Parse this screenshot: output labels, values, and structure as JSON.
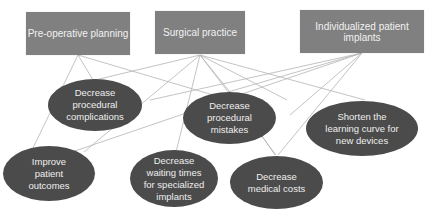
{
  "diagram": {
    "colors": {
      "box": "#808080",
      "ellipse": "#4b4b4b",
      "line": "#b0b0b0",
      "text": "#eeeeee"
    },
    "sources": [
      {
        "id": "pre",
        "label": "Pre-operative planning"
      },
      {
        "id": "surg",
        "label": "Surgical practice"
      },
      {
        "id": "impl",
        "label": "Individualized patient implants"
      }
    ],
    "outcomes": [
      {
        "id": "comp",
        "label": "Decrease\nprocedural\ncomplications"
      },
      {
        "id": "mist",
        "label": "Decrease\nprocedural\nmistakes"
      },
      {
        "id": "learn",
        "label": "Shorten the\nlearning curve for\nnew devices"
      },
      {
        "id": "outc",
        "label": "Improve\npatient\noutcomes"
      },
      {
        "id": "wait",
        "label": "Decrease\nwaiting times\nfor specialized\nimplants"
      },
      {
        "id": "cost",
        "label": "Decrease\nmedical costs"
      }
    ],
    "edges": [
      [
        "pre",
        "comp"
      ],
      [
        "pre",
        "outc"
      ],
      [
        "pre",
        "mist"
      ],
      [
        "surg",
        "comp"
      ],
      [
        "surg",
        "outc"
      ],
      [
        "surg",
        "mist"
      ],
      [
        "surg",
        "wait"
      ],
      [
        "surg",
        "cost"
      ],
      [
        "surg",
        "learn"
      ],
      [
        "impl",
        "comp"
      ],
      [
        "impl",
        "mist"
      ],
      [
        "impl",
        "cost"
      ],
      [
        "impl",
        "learn"
      ],
      [
        "impl",
        "outc"
      ]
    ]
  }
}
